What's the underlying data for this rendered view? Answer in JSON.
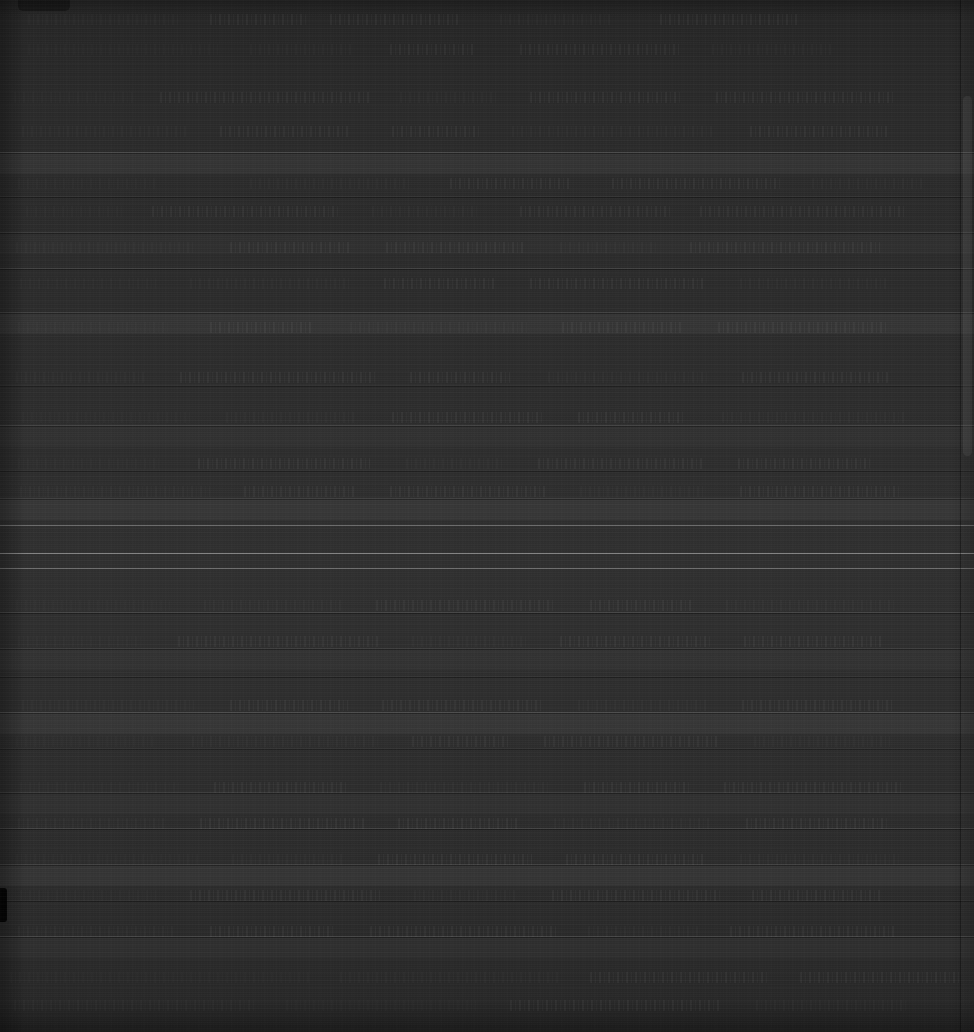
{
  "window": {
    "kind": "dark-application-window",
    "width": 974,
    "height": 1032,
    "legible_text": "",
    "note": "Screenshot is rendered almost entirely black; no text, icon glyph, label, value or number is legible at any zoom level. Only luminance structure is recoverable."
  },
  "colors": {
    "background": "#2a2a2a",
    "background_top": "#262626",
    "background_mid": "#303030",
    "background_bottom": "#272727",
    "tab_nub": "#161616",
    "divider_bright": "#ffffff",
    "left_notch": "#050505",
    "scrollbar_thumb": "#ffffff"
  },
  "chrome": {
    "tab_nub_label": "",
    "scrollbar_label": "",
    "left_notch_label": ""
  },
  "structure": {
    "bright_dividers_y": [
      525,
      553,
      568
    ],
    "mid_dividers_y": [
      152,
      196,
      232,
      268,
      312,
      385,
      425,
      470,
      498,
      612,
      648,
      676,
      712,
      748,
      792,
      828,
      864,
      900,
      936
    ],
    "row_band_height": 36,
    "scrollbar": {
      "x": 961,
      "width": 13,
      "thumb_top": 96,
      "thumb_height": 360
    },
    "left_notch": {
      "y": 888,
      "height": 34,
      "width": 7
    }
  },
  "text_bands": [
    {
      "x": 28,
      "y": 14,
      "w": 150
    },
    {
      "x": 210,
      "y": 14,
      "w": 96
    },
    {
      "x": 330,
      "y": 14,
      "w": 128
    },
    {
      "x": 500,
      "y": 14,
      "w": 112
    },
    {
      "x": 660,
      "y": 14,
      "w": 140
    },
    {
      "x": 28,
      "y": 44,
      "w": 190
    },
    {
      "x": 250,
      "y": 44,
      "w": 104
    },
    {
      "x": 390,
      "y": 44,
      "w": 86
    },
    {
      "x": 520,
      "y": 44,
      "w": 160
    },
    {
      "x": 712,
      "y": 44,
      "w": 120
    },
    {
      "x": 14,
      "y": 92,
      "w": 120
    },
    {
      "x": 160,
      "y": 92,
      "w": 210
    },
    {
      "x": 400,
      "y": 92,
      "w": 96
    },
    {
      "x": 530,
      "y": 92,
      "w": 150
    },
    {
      "x": 716,
      "y": 92,
      "w": 180
    },
    {
      "x": 22,
      "y": 126,
      "w": 164
    },
    {
      "x": 220,
      "y": 126,
      "w": 130
    },
    {
      "x": 392,
      "y": 126,
      "w": 88
    },
    {
      "x": 512,
      "y": 126,
      "w": 200
    },
    {
      "x": 750,
      "y": 126,
      "w": 140
    },
    {
      "x": 18,
      "y": 178,
      "w": 140
    },
    {
      "x": 250,
      "y": 178,
      "w": 160
    },
    {
      "x": 450,
      "y": 178,
      "w": 120
    },
    {
      "x": 612,
      "y": 178,
      "w": 170
    },
    {
      "x": 812,
      "y": 178,
      "w": 110
    },
    {
      "x": 26,
      "y": 206,
      "w": 98
    },
    {
      "x": 152,
      "y": 206,
      "w": 186
    },
    {
      "x": 372,
      "y": 206,
      "w": 106
    },
    {
      "x": 520,
      "y": 206,
      "w": 150
    },
    {
      "x": 700,
      "y": 206,
      "w": 206
    },
    {
      "x": 16,
      "y": 242,
      "w": 180
    },
    {
      "x": 230,
      "y": 242,
      "w": 120
    },
    {
      "x": 386,
      "y": 242,
      "w": 140
    },
    {
      "x": 560,
      "y": 242,
      "w": 96
    },
    {
      "x": 690,
      "y": 242,
      "w": 190
    },
    {
      "x": 20,
      "y": 278,
      "w": 136
    },
    {
      "x": 190,
      "y": 278,
      "w": 160
    },
    {
      "x": 384,
      "y": 278,
      "w": 112
    },
    {
      "x": 530,
      "y": 278,
      "w": 176
    },
    {
      "x": 740,
      "y": 278,
      "w": 148
    },
    {
      "x": 18,
      "y": 322,
      "w": 150
    },
    {
      "x": 210,
      "y": 322,
      "w": 104
    },
    {
      "x": 350,
      "y": 322,
      "w": 178
    },
    {
      "x": 562,
      "y": 322,
      "w": 120
    },
    {
      "x": 718,
      "y": 322,
      "w": 168
    },
    {
      "x": 16,
      "y": 372,
      "w": 128
    },
    {
      "x": 180,
      "y": 372,
      "w": 196
    },
    {
      "x": 410,
      "y": 372,
      "w": 100
    },
    {
      "x": 548,
      "y": 372,
      "w": 160
    },
    {
      "x": 742,
      "y": 372,
      "w": 146
    },
    {
      "x": 22,
      "y": 412,
      "w": 168
    },
    {
      "x": 226,
      "y": 412,
      "w": 128
    },
    {
      "x": 392,
      "y": 412,
      "w": 150
    },
    {
      "x": 578,
      "y": 412,
      "w": 108
    },
    {
      "x": 722,
      "y": 412,
      "w": 184
    },
    {
      "x": 18,
      "y": 458,
      "w": 144
    },
    {
      "x": 198,
      "y": 458,
      "w": 172
    },
    {
      "x": 406,
      "y": 458,
      "w": 96
    },
    {
      "x": 538,
      "y": 458,
      "w": 166
    },
    {
      "x": 738,
      "y": 458,
      "w": 132
    },
    {
      "x": 20,
      "y": 486,
      "w": 190
    },
    {
      "x": 244,
      "y": 486,
      "w": 110
    },
    {
      "x": 390,
      "y": 486,
      "w": 156
    },
    {
      "x": 580,
      "y": 486,
      "w": 124
    },
    {
      "x": 740,
      "y": 486,
      "w": 160
    },
    {
      "x": 16,
      "y": 600,
      "w": 154
    },
    {
      "x": 204,
      "y": 600,
      "w": 138
    },
    {
      "x": 376,
      "y": 600,
      "w": 180
    },
    {
      "x": 590,
      "y": 600,
      "w": 102
    },
    {
      "x": 726,
      "y": 600,
      "w": 170
    },
    {
      "x": 18,
      "y": 636,
      "w": 126
    },
    {
      "x": 178,
      "y": 636,
      "w": 200
    },
    {
      "x": 412,
      "y": 636,
      "w": 114
    },
    {
      "x": 560,
      "y": 636,
      "w": 150
    },
    {
      "x": 744,
      "y": 636,
      "w": 140
    },
    {
      "x": 22,
      "y": 700,
      "w": 172
    },
    {
      "x": 230,
      "y": 700,
      "w": 118
    },
    {
      "x": 382,
      "y": 700,
      "w": 162
    },
    {
      "x": 578,
      "y": 700,
      "w": 130
    },
    {
      "x": 742,
      "y": 700,
      "w": 152
    },
    {
      "x": 16,
      "y": 736,
      "w": 140
    },
    {
      "x": 192,
      "y": 736,
      "w": 186
    },
    {
      "x": 412,
      "y": 736,
      "w": 98
    },
    {
      "x": 544,
      "y": 736,
      "w": 176
    },
    {
      "x": 754,
      "y": 736,
      "w": 136
    },
    {
      "x": 20,
      "y": 782,
      "w": 160
    },
    {
      "x": 214,
      "y": 782,
      "w": 132
    },
    {
      "x": 380,
      "y": 782,
      "w": 170
    },
    {
      "x": 584,
      "y": 782,
      "w": 106
    },
    {
      "x": 724,
      "y": 782,
      "w": 178
    },
    {
      "x": 18,
      "y": 818,
      "w": 148
    },
    {
      "x": 200,
      "y": 818,
      "w": 164
    },
    {
      "x": 398,
      "y": 818,
      "w": 122
    },
    {
      "x": 554,
      "y": 818,
      "w": 158
    },
    {
      "x": 746,
      "y": 818,
      "w": 144
    },
    {
      "x": 16,
      "y": 854,
      "w": 182
    },
    {
      "x": 232,
      "y": 854,
      "w": 112
    },
    {
      "x": 378,
      "y": 854,
      "w": 154
    },
    {
      "x": 566,
      "y": 854,
      "w": 140
    },
    {
      "x": 740,
      "y": 854,
      "w": 162
    },
    {
      "x": 20,
      "y": 890,
      "w": 136
    },
    {
      "x": 190,
      "y": 890,
      "w": 190
    },
    {
      "x": 414,
      "y": 890,
      "w": 104
    },
    {
      "x": 552,
      "y": 890,
      "w": 168
    },
    {
      "x": 752,
      "y": 890,
      "w": 130
    },
    {
      "x": 18,
      "y": 926,
      "w": 158
    },
    {
      "x": 210,
      "y": 926,
      "w": 126
    },
    {
      "x": 370,
      "y": 926,
      "w": 186
    },
    {
      "x": 588,
      "y": 926,
      "w": 110
    },
    {
      "x": 730,
      "y": 926,
      "w": 166
    },
    {
      "x": 10,
      "y": 972,
      "w": 300
    },
    {
      "x": 340,
      "y": 972,
      "w": 220
    },
    {
      "x": 590,
      "y": 972,
      "w": 180
    },
    {
      "x": 800,
      "y": 972,
      "w": 160
    },
    {
      "x": 14,
      "y": 1000,
      "w": 240
    },
    {
      "x": 286,
      "y": 1000,
      "w": 190
    },
    {
      "x": 510,
      "y": 1000,
      "w": 210
    },
    {
      "x": 756,
      "y": 1000,
      "w": 150
    }
  ]
}
